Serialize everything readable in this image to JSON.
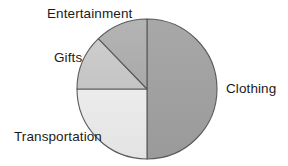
{
  "chart_data": {
    "type": "pie",
    "title": "",
    "subtitle": "",
    "xlabel": "",
    "ylabel": "",
    "legend_position": "none",
    "grid": false,
    "labels_placement": "outside-callout",
    "categories": [
      "Clothing",
      "Transportation",
      "Gifts",
      "Entertainment"
    ],
    "values": [
      50,
      25,
      12.5,
      12.5
    ],
    "units": "percent",
    "slices": [
      {
        "label": "Clothing",
        "value": 50,
        "percent": 50,
        "start_angle_deg": 0,
        "end_angle_deg": 180,
        "color": "#a2a2a2",
        "label_position": "right"
      },
      {
        "label": "Transportation",
        "value": 25,
        "percent": 25,
        "start_angle_deg": 180,
        "end_angle_deg": 270,
        "color": "#e9e9e9",
        "label_position": "bottom-left"
      },
      {
        "label": "Gifts",
        "value": 12.5,
        "percent": 12.5,
        "start_angle_deg": 270,
        "end_angle_deg": 316,
        "color": "#c9c9c9",
        "label_position": "left"
      },
      {
        "label": "Entertainment",
        "value": 12.5,
        "percent": 12.5,
        "start_angle_deg": 316,
        "end_angle_deg": 360,
        "color": "#afafaf",
        "label_position": "top-left"
      }
    ],
    "geometry": {
      "center_x": 147,
      "center_y": 89,
      "radius": 70
    },
    "style": {
      "background": "#ffffff",
      "outline_color": "#5a5a5a",
      "outline_width": 1.1,
      "text_color": "#1b1b1b"
    }
  }
}
